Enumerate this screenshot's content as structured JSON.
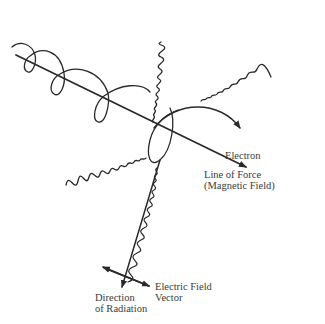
{
  "diagram": {
    "colors": {
      "ink": "#2a2a2a",
      "background": "#ffffff",
      "text": "#3a3a3a"
    },
    "labels": {
      "electron": "Electron",
      "line_of_force_1": "Line of Force",
      "line_of_force_2": "(Magnetic Field)",
      "electric_field_1": "Electric Field",
      "electric_field_2": "Vector",
      "direction_1": "Direction",
      "direction_2": "of Radiation"
    },
    "elements": [
      {
        "id": "magnetic-field-line",
        "type": "arrow",
        "from": [
          15,
          55
        ],
        "to": [
          248,
          168
        ]
      },
      {
        "id": "electron-helix",
        "type": "helical-path",
        "loops": 4
      },
      {
        "id": "electron-arrow",
        "type": "curved-arrow",
        "to": [
          248,
          152
        ]
      },
      {
        "id": "wave-top",
        "type": "wavy-line",
        "direction": "up"
      },
      {
        "id": "wave-right",
        "type": "wavy-line",
        "direction": "upper-right"
      },
      {
        "id": "wave-left",
        "type": "wavy-line",
        "direction": "left"
      },
      {
        "id": "wave-down",
        "type": "polarized-wave",
        "direction": "down-left"
      },
      {
        "id": "electric-field-vector",
        "type": "double-arrow"
      },
      {
        "id": "radiation-direction-arrow",
        "type": "arrow"
      }
    ]
  }
}
